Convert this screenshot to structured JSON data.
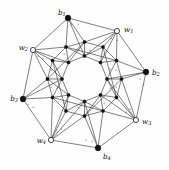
{
  "figure": {
    "background_color": "#fefefe",
    "edge_color": "#2b2b2b",
    "filled_vertex_color": "#111111",
    "open_vertex_fill": "#ffffff",
    "open_vertex_stroke": "#1a1a1a"
  },
  "outer_vertices": [
    {
      "id": "b1",
      "base": "b",
      "sub": "1",
      "type": "filled",
      "x": 68,
      "y": 18,
      "label_x": 58,
      "label_y": 13,
      "anchor": "start"
    },
    {
      "id": "w1",
      "base": "w",
      "sub": "1",
      "type": "open",
      "x": 117,
      "y": 31,
      "label_x": 124,
      "label_y": 30,
      "anchor": "start"
    },
    {
      "id": "b2",
      "base": "b",
      "sub": "2",
      "type": "filled",
      "x": 146,
      "y": 72,
      "label_x": 152,
      "label_y": 73,
      "anchor": "start"
    },
    {
      "id": "w3",
      "base": "w",
      "sub": "3",
      "type": "open",
      "x": 136,
      "y": 120,
      "label_x": 142,
      "label_y": 122,
      "anchor": "start"
    },
    {
      "id": "b4",
      "base": "b",
      "sub": "4",
      "type": "filled",
      "x": 98,
      "y": 148,
      "label_x": 103,
      "label_y": 157,
      "anchor": "start"
    },
    {
      "id": "w4",
      "base": "w",
      "sub": "4",
      "type": "open",
      "x": 51,
      "y": 140,
      "label_x": 46,
      "label_y": 141,
      "anchor": "end"
    },
    {
      "id": "b3",
      "base": "b",
      "sub": "3",
      "type": "filled",
      "x": 23,
      "y": 99,
      "label_x": 18,
      "label_y": 99,
      "anchor": "end"
    },
    {
      "id": "w2",
      "base": "w",
      "sub": "2",
      "type": "open",
      "x": 33,
      "y": 50,
      "label_x": 28,
      "label_y": 48,
      "anchor": "end"
    }
  ],
  "mid_vertices": [
    {
      "id": "m0",
      "x": 84.5,
      "y": 42.0
    },
    {
      "id": "m1",
      "x": 103.0,
      "y": 47.0
    },
    {
      "id": "m2",
      "x": 116.5,
      "y": 60.5
    },
    {
      "id": "m3",
      "x": 121.5,
      "y": 79.0
    },
    {
      "id": "m4",
      "x": 116.5,
      "y": 97.5
    },
    {
      "id": "m5",
      "x": 103.0,
      "y": 111.0
    },
    {
      "id": "m6",
      "x": 84.5,
      "y": 116.0
    },
    {
      "id": "m7",
      "x": 66.0,
      "y": 111.0
    },
    {
      "id": "m8",
      "x": 52.5,
      "y": 97.5
    },
    {
      "id": "m9",
      "x": 47.5,
      "y": 79.0
    },
    {
      "id": "m10",
      "x": 52.5,
      "y": 60.5
    },
    {
      "id": "m11",
      "x": 66.0,
      "y": 47.0
    }
  ],
  "inner_vertices": [
    {
      "id": "i0",
      "x": 84.5,
      "y": 56.0
    },
    {
      "id": "i1",
      "x": 100.5,
      "y": 62.5
    },
    {
      "id": "i2",
      "x": 107.0,
      "y": 79.0
    },
    {
      "id": "i3",
      "x": 100.5,
      "y": 95.0
    },
    {
      "id": "i4",
      "x": 84.5,
      "y": 101.5
    },
    {
      "id": "i5",
      "x": 68.5,
      "y": 95.0
    },
    {
      "id": "i6",
      "x": 62.0,
      "y": 79.0
    },
    {
      "id": "i7",
      "x": 68.5,
      "y": 62.5
    }
  ],
  "edge_ticks": [
    {
      "text": "x",
      "x": 71,
      "y": 25
    },
    {
      "text": "x",
      "x": 78,
      "y": 25
    },
    {
      "text": "x",
      "x": 111,
      "y": 39
    },
    {
      "text": "x",
      "x": 117,
      "y": 41
    },
    {
      "text": "x",
      "x": 38,
      "y": 57
    },
    {
      "text": "x",
      "x": 43,
      "y": 59
    },
    {
      "text": "x",
      "x": 140,
      "y": 80
    },
    {
      "text": "x",
      "x": 143,
      "y": 86
    },
    {
      "text": "x",
      "x": 28,
      "y": 105
    },
    {
      "text": "x",
      "x": 33,
      "y": 108
    },
    {
      "text": "x",
      "x": 126,
      "y": 113
    },
    {
      "text": "x",
      "x": 130,
      "y": 110
    },
    {
      "text": "x",
      "x": 57,
      "y": 133
    },
    {
      "text": "x",
      "x": 61,
      "y": 130
    },
    {
      "text": "x",
      "x": 92,
      "y": 142
    },
    {
      "text": "x",
      "x": 86,
      "y": 141
    },
    {
      "text": "x",
      "x": 79,
      "y": 51
    },
    {
      "text": "x",
      "x": 90,
      "y": 51
    },
    {
      "text": "x",
      "x": 110,
      "y": 70
    },
    {
      "text": "x",
      "x": 110,
      "y": 89
    },
    {
      "text": "x",
      "x": 90,
      "y": 108
    },
    {
      "text": "x",
      "x": 78,
      "y": 108
    },
    {
      "text": "x",
      "x": 57,
      "y": 89
    },
    {
      "text": "x",
      "x": 57,
      "y": 70
    },
    {
      "text": "x",
      "x": 64,
      "y": 55
    },
    {
      "text": "x",
      "x": 104,
      "y": 55
    },
    {
      "text": "x",
      "x": 116,
      "y": 88
    },
    {
      "text": "x",
      "x": 104,
      "y": 104
    },
    {
      "text": "x",
      "x": 64,
      "y": 104
    },
    {
      "text": "x",
      "x": 51,
      "y": 88
    },
    {
      "text": "x",
      "x": 51,
      "y": 71
    },
    {
      "text": "x",
      "x": 116,
      "y": 71
    }
  ],
  "edges_outer_ring": [
    [
      "b1",
      "w1"
    ],
    [
      "w1",
      "b2"
    ],
    [
      "b2",
      "w3"
    ],
    [
      "w3",
      "b4"
    ],
    [
      "b4",
      "w4"
    ],
    [
      "w4",
      "b3"
    ],
    [
      "b3",
      "w2"
    ],
    [
      "w2",
      "b1"
    ]
  ],
  "edges_outer_to_mid": [
    [
      "b1",
      "m11"
    ],
    [
      "b1",
      "m0"
    ],
    [
      "w1",
      "m0"
    ],
    [
      "w1",
      "m1"
    ],
    [
      "w1",
      "m2"
    ],
    [
      "b2",
      "m2"
    ],
    [
      "b2",
      "m3"
    ],
    [
      "w3",
      "m4"
    ],
    [
      "w3",
      "m5"
    ],
    [
      "w3",
      "m3"
    ],
    [
      "b4",
      "m5"
    ],
    [
      "b4",
      "m6"
    ],
    [
      "w4",
      "m7"
    ],
    [
      "w4",
      "m8"
    ],
    [
      "w4",
      "m6"
    ],
    [
      "b3",
      "m8"
    ],
    [
      "b3",
      "m9"
    ],
    [
      "w2",
      "m10"
    ],
    [
      "w2",
      "m11"
    ],
    [
      "w2",
      "m9"
    ]
  ],
  "edges_mid_ring": [
    [
      "m0",
      "m1"
    ],
    [
      "m1",
      "m2"
    ],
    [
      "m2",
      "m3"
    ],
    [
      "m3",
      "m4"
    ],
    [
      "m4",
      "m5"
    ],
    [
      "m5",
      "m6"
    ],
    [
      "m6",
      "m7"
    ],
    [
      "m7",
      "m8"
    ],
    [
      "m8",
      "m9"
    ],
    [
      "m9",
      "m10"
    ],
    [
      "m10",
      "m11"
    ],
    [
      "m11",
      "m0"
    ]
  ],
  "edges_mid_to_inner": [
    [
      "m0",
      "i0"
    ],
    [
      "m11",
      "i0"
    ],
    [
      "m11",
      "i7"
    ],
    [
      "m2",
      "i1"
    ],
    [
      "m1",
      "i1"
    ],
    [
      "m1",
      "i0"
    ],
    [
      "m3",
      "i2"
    ],
    [
      "m2",
      "i2"
    ],
    [
      "m4",
      "i2"
    ],
    [
      "m5",
      "i3"
    ],
    [
      "m4",
      "i3"
    ],
    [
      "m6",
      "i3"
    ],
    [
      "m6",
      "i4"
    ],
    [
      "m7",
      "i4"
    ],
    [
      "m5",
      "i4"
    ],
    [
      "m8",
      "i5"
    ],
    [
      "m7",
      "i5"
    ],
    [
      "m9",
      "i5"
    ],
    [
      "m9",
      "i6"
    ],
    [
      "m10",
      "i6"
    ],
    [
      "m8",
      "i6"
    ],
    [
      "m10",
      "i7"
    ],
    [
      "m0",
      "i7"
    ]
  ],
  "edges_inner_ring": [
    [
      "i0",
      "i1"
    ],
    [
      "i1",
      "i2"
    ],
    [
      "i2",
      "i3"
    ],
    [
      "i3",
      "i4"
    ],
    [
      "i4",
      "i5"
    ],
    [
      "i5",
      "i6"
    ],
    [
      "i6",
      "i7"
    ],
    [
      "i7",
      "i0"
    ]
  ],
  "edges_chords": [
    [
      "b1",
      "i0"
    ],
    [
      "w1",
      "i1"
    ],
    [
      "w1",
      "i0"
    ],
    [
      "b2",
      "i2"
    ],
    [
      "w3",
      "i3"
    ],
    [
      "w3",
      "i2"
    ],
    [
      "b4",
      "i4"
    ],
    [
      "w4",
      "i5"
    ],
    [
      "w4",
      "i4"
    ],
    [
      "b3",
      "i6"
    ],
    [
      "w2",
      "i7"
    ],
    [
      "w2",
      "i6"
    ]
  ],
  "edges_long_diagonals": [
    [
      "m11",
      "m2"
    ],
    [
      "m1",
      "m4"
    ],
    [
      "m3",
      "m6"
    ],
    [
      "m5",
      "m8"
    ],
    [
      "m7",
      "m10"
    ],
    [
      "m9",
      "m0"
    ]
  ]
}
